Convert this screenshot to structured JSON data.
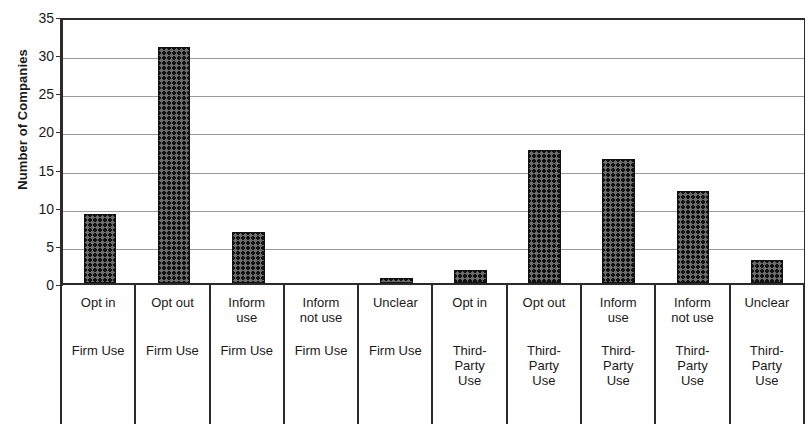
{
  "chart_data": {
    "type": "bar",
    "title": "",
    "xlabel": "",
    "ylabel": "Number of Companies",
    "ylim": [
      0,
      35
    ],
    "yticks": [
      0,
      5,
      10,
      15,
      20,
      25,
      30,
      35
    ],
    "grid": true,
    "legend": "none",
    "bar_color": "#555555",
    "bar_pattern": "cross-hatch-checkered",
    "categories": [
      "Opt in",
      "Opt out",
      "Inform use",
      "Inform not use",
      "Unclear",
      "Opt in",
      "Opt out",
      "Inform use",
      "Inform not use",
      "Unclear"
    ],
    "groups": [
      "Firm Use",
      "Firm Use",
      "Firm Use",
      "Firm Use",
      "Firm Use",
      "Third-Party Use",
      "Third-Party Use",
      "Third-Party Use",
      "Third-Party Use",
      "Third-Party Use"
    ],
    "values": [
      9,
      31,
      6.7,
      0,
      0.7,
      1.7,
      17.5,
      16.3,
      12.1,
      3
    ]
  },
  "axis": {
    "y_title": "Number of Companies",
    "y_tick_labels": [
      "35",
      "30",
      "25",
      "20",
      "15",
      "10",
      "5",
      "0"
    ]
  },
  "cat_labels": [
    {
      "name": "Opt in",
      "group_line1": "Firm Use",
      "group_line2": "",
      "group_line3": ""
    },
    {
      "name": "Opt out",
      "group_line1": "Firm Use",
      "group_line2": "",
      "group_line3": ""
    },
    {
      "name": "Inform\nuse",
      "group_line1": "Firm Use",
      "group_line2": "",
      "group_line3": ""
    },
    {
      "name": "Inform\nnot use",
      "group_line1": "Firm Use",
      "group_line2": "",
      "group_line3": ""
    },
    {
      "name": "Unclear",
      "group_line1": "Firm Use",
      "group_line2": "",
      "group_line3": ""
    },
    {
      "name": "Opt in",
      "group_line1": "Third-",
      "group_line2": "Party",
      "group_line3": "Use"
    },
    {
      "name": "Opt out",
      "group_line1": "Third-",
      "group_line2": "Party",
      "group_line3": "Use"
    },
    {
      "name": "Inform\nuse",
      "group_line1": "Third-",
      "group_line2": "Party",
      "group_line3": "Use"
    },
    {
      "name": "Inform\nnot use",
      "group_line1": "Third-",
      "group_line2": "Party",
      "group_line3": "Use"
    },
    {
      "name": "Unclear",
      "group_line1": "Third-",
      "group_line2": "Party",
      "group_line3": "Use"
    }
  ]
}
